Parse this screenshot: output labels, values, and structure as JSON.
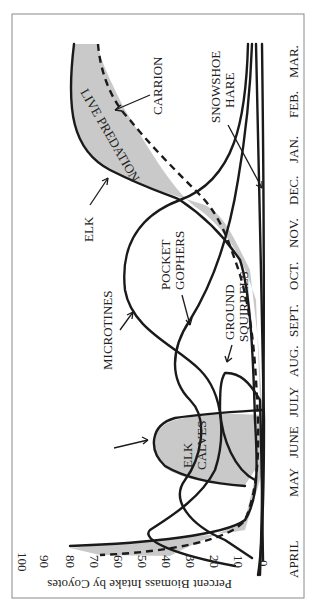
{
  "chart_data": {
    "type": "line",
    "orientation": "rotated 90 degrees counter-clockwise",
    "title": "",
    "xlabel": "",
    "ylabel": "Percent Biomass Intake by Coyotes",
    "ylim": [
      0,
      100
    ],
    "yticks": [
      "0",
      "10",
      "20",
      "30",
      "40",
      "50",
      "60",
      "70",
      "80",
      "90",
      "100"
    ],
    "categories": [
      "APRIL",
      "MAY",
      "JUNE",
      "JULY",
      "AUG.",
      "SEPT.",
      "OCT.",
      "NOV.",
      "DEC.",
      "JAN.",
      "FEB.",
      "MAR."
    ],
    "grid": false,
    "legend": "inline labels",
    "series": [
      {
        "name": "ELK",
        "style": "solid",
        "values": [
          80,
          8,
          3,
          2,
          2,
          3,
          10,
          35,
          45,
          62,
          72,
          80
        ]
      },
      {
        "name": "CARRION",
        "style": "dashed",
        "values": [
          68,
          3,
          2,
          2,
          2,
          3,
          8,
          25,
          40,
          55,
          65,
          72
        ]
      },
      {
        "name": "ELK CALVES",
        "style": "solid",
        "values": [
          0,
          20,
          45,
          35,
          3,
          0,
          0,
          0,
          0,
          0,
          0,
          0
        ]
      },
      {
        "name": "MICROTINES",
        "style": "solid",
        "values": [
          10,
          42,
          38,
          22,
          18,
          38,
          52,
          50,
          35,
          20,
          10,
          5
        ]
      },
      {
        "name": "POCKET GOPHERS",
        "style": "solid",
        "values": [
          5,
          28,
          30,
          20,
          28,
          22,
          12,
          5,
          3,
          2,
          2,
          2
        ]
      },
      {
        "name": "GROUND SQUIRRELS",
        "style": "solid",
        "values": [
          0,
          2,
          5,
          28,
          18,
          3,
          0,
          0,
          0,
          0,
          0,
          0
        ]
      },
      {
        "name": "SNOWSHOE HARE",
        "style": "solid",
        "values": [
          2,
          3,
          4,
          5,
          5,
          5,
          6,
          8,
          10,
          8,
          5,
          3
        ]
      }
    ],
    "shaded_regions": [
      "LIVE PREDATION (between ELK and CARRION)",
      "ELK CALVES"
    ],
    "annotations": [
      "LIVE PREDATION",
      "CARRION",
      "ELK",
      "ELK CALVES",
      "MICROTINES",
      "POCKET GOPHERS",
      "GROUND SQUIRRELS",
      "SNOWSHOE HARE"
    ]
  },
  "axis": {
    "ylabel": "Percent Biomass Intake by Coyotes",
    "ticks": [
      "100",
      "90",
      "80",
      "70",
      "60",
      "50",
      "40",
      "30",
      "20",
      "10",
      "0"
    ],
    "months": [
      "APRIL",
      "MAY",
      "JUNE",
      "JULY",
      "AUG.",
      "SEPT.",
      "OCT.",
      "NOV.",
      "DEC.",
      "JAN.",
      "FEB.",
      "MAR."
    ]
  },
  "labels": {
    "live_predation": "LIVE PREDATION",
    "carrion": "CARRION",
    "elk": "ELK",
    "elk_calves_1": "ELK",
    "elk_calves_2": "CALVES",
    "microtines": "MICROTINES",
    "pocket_1": "POCKET",
    "pocket_2": "GOPHERS",
    "ground_1": "GROUND",
    "ground_2": "SQUIRRELS",
    "hare_1": "SNOWSHOE",
    "hare_2": "HARE"
  }
}
